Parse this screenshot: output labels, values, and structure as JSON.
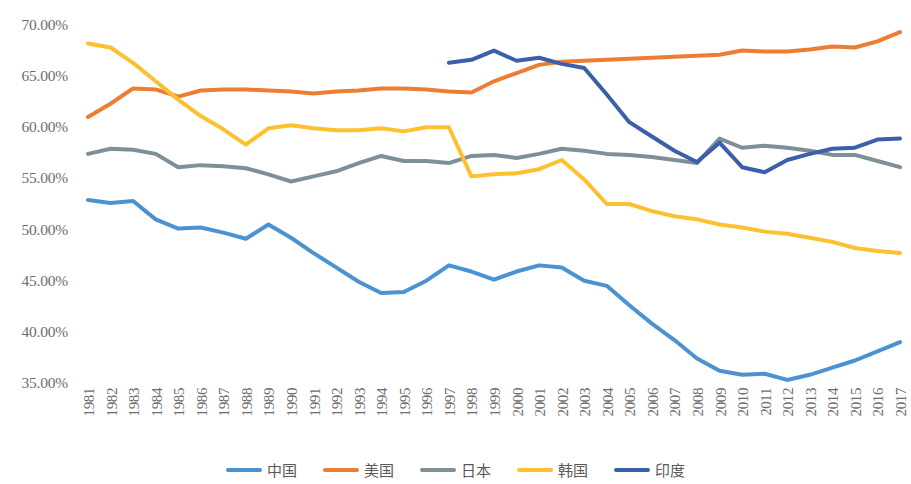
{
  "chart_data": {
    "type": "line",
    "title": "",
    "subtitle": "",
    "xlabel": "",
    "ylabel": "",
    "grid": false,
    "legend_position": "bottom",
    "ylim": [
      0.35,
      0.7
    ],
    "ytick_labels": [
      "70.00%",
      "65.00%",
      "60.00%",
      "55.00%",
      "50.00%",
      "45.00%",
      "40.00%",
      "35.00%"
    ],
    "ytick_values": [
      0.7,
      0.65,
      0.6,
      0.55,
      0.5,
      0.45,
      0.4,
      0.35
    ],
    "x": [
      1981,
      1982,
      1983,
      1984,
      1985,
      1986,
      1987,
      1988,
      1989,
      1990,
      1991,
      1992,
      1993,
      1994,
      1995,
      1996,
      1997,
      1998,
      1999,
      2000,
      2001,
      2002,
      2003,
      2004,
      2005,
      2006,
      2007,
      2008,
      2009,
      2010,
      2011,
      2012,
      2013,
      2014,
      2015,
      2016,
      2017
    ],
    "xtick_labels": [
      "1981",
      "1982",
      "1983",
      "1984",
      "1985",
      "1986",
      "1987",
      "1988",
      "1989",
      "1990",
      "1991",
      "1992",
      "1993",
      "1994",
      "1995",
      "1996",
      "1997",
      "1998",
      "1999",
      "2000",
      "2001",
      "2002",
      "2003",
      "2004",
      "2005",
      "2006",
      "2007",
      "2008",
      "2009",
      "2010",
      "2011",
      "2012",
      "2013",
      "2014",
      "2015",
      "2016",
      "2017"
    ],
    "series": [
      {
        "name": "中国",
        "color": "#4B92D0",
        "values": [
          52.9,
          52.6,
          52.8,
          51.0,
          50.1,
          50.2,
          49.7,
          49.1,
          50.5,
          49.2,
          47.7,
          46.3,
          44.9,
          43.8,
          43.9,
          45.0,
          46.5,
          45.9,
          45.1,
          45.9,
          46.5,
          46.3,
          45.0,
          44.5,
          42.6,
          40.8,
          39.2,
          37.4,
          36.2,
          35.8,
          35.9,
          35.3,
          35.8,
          36.5,
          37.2,
          38.1,
          39.0
        ]
      },
      {
        "name": "美国",
        "color": "#ED7D31",
        "values": [
          61.0,
          62.3,
          63.8,
          63.7,
          63.0,
          63.6,
          63.7,
          63.7,
          63.6,
          63.5,
          63.3,
          63.5,
          63.6,
          63.8,
          63.8,
          63.7,
          63.5,
          63.4,
          64.5,
          65.3,
          66.1,
          66.4,
          66.5,
          66.6,
          66.7,
          66.8,
          66.9,
          67.0,
          67.1,
          67.5,
          67.4,
          67.4,
          67.6,
          67.9,
          67.8,
          68.4,
          69.3
        ]
      },
      {
        "name": "日本",
        "color": "#7D9097",
        "values": [
          57.4,
          57.9,
          57.8,
          57.4,
          56.1,
          56.3,
          56.2,
          56.0,
          55.4,
          54.7,
          55.2,
          55.7,
          56.5,
          57.2,
          56.7,
          56.7,
          56.5,
          57.2,
          57.3,
          57.0,
          57.4,
          57.9,
          57.7,
          57.4,
          57.3,
          57.1,
          56.8,
          56.5,
          58.9,
          58.0,
          58.2,
          58.0,
          57.7,
          57.3,
          57.3,
          56.7,
          56.1
        ]
      },
      {
        "name": "韩国",
        "color": "#FDC130",
        "values": [
          68.2,
          67.8,
          66.3,
          64.5,
          62.7,
          61.1,
          59.8,
          58.3,
          59.9,
          60.2,
          59.9,
          59.7,
          59.7,
          59.9,
          59.6,
          60.0,
          60.0,
          55.2,
          55.4,
          55.5,
          55.9,
          56.8,
          54.9,
          52.5,
          52.5,
          51.8,
          51.3,
          51.0,
          50.5,
          50.2,
          49.8,
          49.6,
          49.2,
          48.8,
          48.2,
          47.9,
          47.7
        ]
      },
      {
        "name": "印度",
        "color": "#3B5FA8",
        "values": [
          null,
          null,
          null,
          null,
          null,
          null,
          null,
          null,
          null,
          null,
          null,
          null,
          null,
          null,
          null,
          null,
          66.3,
          66.6,
          67.5,
          66.5,
          66.8,
          66.2,
          65.8,
          63.2,
          60.5,
          59.1,
          57.7,
          56.6,
          58.5,
          56.1,
          55.6,
          56.8,
          57.4,
          57.9,
          58.0,
          58.8,
          58.9
        ]
      }
    ]
  },
  "legend": {
    "items": [
      {
        "label": "中国",
        "color": "#4B92D0"
      },
      {
        "label": "美国",
        "color": "#ED7D31"
      },
      {
        "label": "日本",
        "color": "#7D9097"
      },
      {
        "label": "韩国",
        "color": "#FDC130"
      },
      {
        "label": "印度",
        "color": "#3B5FA8"
      }
    ]
  }
}
